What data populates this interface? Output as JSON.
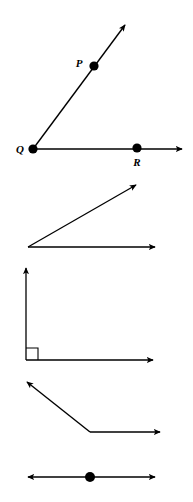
{
  "figure": {
    "background_color": "#ffffff",
    "stroke_color": "#000000",
    "canvas": {
      "width": 193,
      "height": 502
    }
  },
  "diagrams": [
    {
      "id": "angle-pqr",
      "name": "labeled-acute-angle",
      "type": "angle",
      "classification": "acute",
      "vertex": {
        "label": "Q",
        "x": 33,
        "y": 149
      },
      "points": [
        {
          "label": "P",
          "x": 94,
          "y": 66,
          "label_x": 79,
          "label_y": 63
        },
        {
          "label": "R",
          "x": 137,
          "y": 148,
          "label_x": 137,
          "label_y": 162
        }
      ],
      "rays": [
        {
          "name": "ray-qp",
          "from": [
            33,
            149
          ],
          "to": [
            125,
            25
          ],
          "arrow": true
        },
        {
          "name": "ray-qr",
          "from": [
            33,
            149
          ],
          "to": [
            182,
            149
          ],
          "arrow": true
        }
      ]
    },
    {
      "id": "angle-acute-unlabeled",
      "name": "unlabeled-acute-angle",
      "type": "angle",
      "classification": "acute",
      "vertex": {
        "label": "",
        "x": 28,
        "y": 247
      },
      "points": [],
      "rays": [
        {
          "name": "ray-upper",
          "from": [
            28,
            247
          ],
          "to": [
            136,
            185
          ],
          "arrow": true
        },
        {
          "name": "ray-lower",
          "from": [
            28,
            247
          ],
          "to": [
            155,
            247
          ],
          "arrow": true
        }
      ]
    },
    {
      "id": "angle-right",
      "name": "right-angle",
      "type": "angle",
      "classification": "right",
      "vertex": {
        "label": "",
        "x": 26,
        "y": 360
      },
      "points": [],
      "rays": [
        {
          "name": "ray-vertical",
          "from": [
            26,
            360
          ],
          "to": [
            26,
            268
          ],
          "arrow": true
        },
        {
          "name": "ray-horizontal",
          "from": [
            26,
            360
          ],
          "to": [
            153,
            360
          ],
          "arrow": true
        }
      ],
      "right_angle_marker": {
        "x": 26,
        "y": 360,
        "size": 12
      }
    },
    {
      "id": "angle-obtuse",
      "name": "obtuse-angle",
      "type": "angle",
      "classification": "obtuse",
      "vertex": {
        "label": "",
        "x": 90,
        "y": 432
      },
      "points": [],
      "rays": [
        {
          "name": "ray-upper-left",
          "from": [
            90,
            432
          ],
          "to": [
            27,
            382
          ],
          "arrow": true
        },
        {
          "name": "ray-right",
          "from": [
            90,
            432
          ],
          "to": [
            160,
            432
          ],
          "arrow": true
        }
      ]
    },
    {
      "id": "line-straight",
      "name": "straight-line-with-point",
      "type": "line",
      "classification": "straight",
      "vertex": {
        "label": "",
        "x": 90,
        "y": 477
      },
      "points": [
        {
          "label": "",
          "x": 90,
          "y": 477,
          "label_x": 90,
          "label_y": 477
        }
      ],
      "rays": [
        {
          "name": "ray-left",
          "from": [
            90,
            477
          ],
          "to": [
            28,
            477
          ],
          "arrow": true
        },
        {
          "name": "ray-right",
          "from": [
            90,
            477
          ],
          "to": [
            155,
            477
          ],
          "arrow": true
        }
      ]
    }
  ]
}
